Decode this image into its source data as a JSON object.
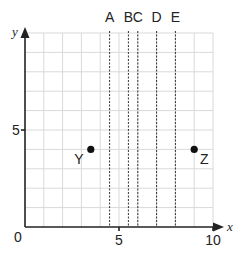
{
  "axes": {
    "x_label": "x",
    "y_label": "y",
    "origin_label": "0",
    "x_ticks": [
      {
        "value": 5,
        "label": "5"
      },
      {
        "value": 10,
        "label": "10"
      }
    ],
    "y_ticks": [
      {
        "value": 5,
        "label": "5"
      }
    ],
    "x_range": [
      0,
      10
    ],
    "y_range": [
      0,
      10
    ]
  },
  "vertical_lines": [
    {
      "label": "A",
      "x": 4.5
    },
    {
      "label": "B",
      "x": 5.5
    },
    {
      "label": "C",
      "x": 6
    },
    {
      "label": "D",
      "x": 7
    },
    {
      "label": "E",
      "x": 8
    }
  ],
  "points": [
    {
      "label": "Y",
      "x": 3.5,
      "y": 4
    },
    {
      "label": "Z",
      "x": 9,
      "y": 4
    }
  ],
  "colors": {
    "grid": "#d9d9d9",
    "axis": "#222222",
    "point": "#111111"
  }
}
